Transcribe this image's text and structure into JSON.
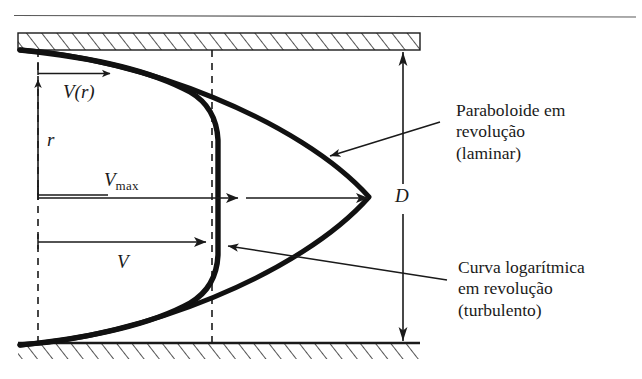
{
  "figure": {
    "type": "technical-diagram",
    "background_color": "#ffffff",
    "line_color": "#1a1a1a",
    "curve_color": "#111111",
    "labels": {
      "velocity_profile": "V(r)",
      "radius": "r",
      "v_max_symbol": "V",
      "v_max_subscript": "max",
      "mean_velocity": "V",
      "diameter": "D"
    },
    "annotations": [
      {
        "id": "laminar",
        "lines": [
          "Paraboloide em",
          "revolução",
          "(laminar)"
        ],
        "points_to": "parabolic-velocity-curve"
      },
      {
        "id": "turbulent",
        "lines": [
          "Curva logarítmica",
          "em revolução",
          "(turbulento)"
        ],
        "points_to": "logarithmic-velocity-curve"
      }
    ],
    "walls": {
      "top_wall": "hatched-pipe-wall-top",
      "bottom_wall": "hatched-pipe-wall-bottom"
    }
  }
}
